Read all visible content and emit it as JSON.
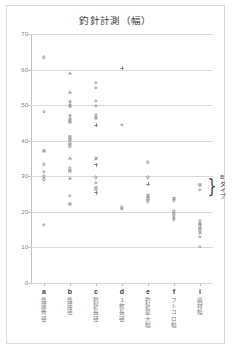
{
  "chart": {
    "title": "釣針計測（幅）",
    "annotation": {
      "brace": "}",
      "label": "Bタイプ"
    }
  },
  "chart_data": {
    "type": "scatter",
    "title": "釣針計測（幅）",
    "xlabel": "",
    "ylabel": "",
    "ylim": [
      0,
      70
    ],
    "yticks": [
      0,
      10,
      20,
      30,
      40,
      50,
      60,
      70
    ],
    "grid": true,
    "legend": "none",
    "categories": [
      "a",
      "b",
      "c",
      "d",
      "e",
      "f",
      "i"
    ],
    "category_names": [
      "角座骨径",
      "角座径",
      "釣針長径",
      "1枚長径",
      "釣針最大幅",
      "フトコロ幅",
      "廃材幅"
    ],
    "annotations": [
      {
        "text": "Bタイプ",
        "category": "i",
        "y_range": [
          25.5,
          28.5
        ],
        "marker": "brace"
      }
    ],
    "series": [
      {
        "name": "a",
        "category": "a",
        "points": [
          {
            "y": 63.5,
            "marker": "circle"
          },
          {
            "y": 48.2,
            "marker": "circle"
          },
          {
            "y": 37.2,
            "marker": "square"
          },
          {
            "y": 33.4,
            "marker": "circle"
          },
          {
            "y": 31.2,
            "marker": "circle"
          },
          {
            "y": 30.0,
            "marker": "circle"
          },
          {
            "y": 29.2,
            "marker": "circle"
          },
          {
            "y": 16.3,
            "marker": "circle"
          }
        ]
      },
      {
        "name": "b",
        "category": "b",
        "points": [
          {
            "y": 59.0,
            "marker": "triangle"
          },
          {
            "y": 53.6,
            "marker": "triangle"
          },
          {
            "y": 51.3,
            "marker": "triangle"
          },
          {
            "y": 50.4,
            "marker": "triangle"
          },
          {
            "y": 49.8,
            "marker": "triangle"
          },
          {
            "y": 47.2,
            "marker": "triangle"
          },
          {
            "y": 46.4,
            "marker": "triangle"
          },
          {
            "y": 45.9,
            "marker": "circle"
          },
          {
            "y": 45.4,
            "marker": "square"
          },
          {
            "y": 41.0,
            "marker": "square"
          },
          {
            "y": 40.3,
            "marker": "square"
          },
          {
            "y": 39.1,
            "marker": "square"
          },
          {
            "y": 38.4,
            "marker": "circle"
          },
          {
            "y": 35.2,
            "marker": "triangle"
          },
          {
            "y": 32.2,
            "marker": "circle"
          },
          {
            "y": 31.6,
            "marker": "square"
          },
          {
            "y": 29.6,
            "marker": "triangle"
          },
          {
            "y": 24.5,
            "marker": "circle"
          },
          {
            "y": 22.3,
            "marker": "square"
          }
        ]
      },
      {
        "name": "c",
        "category": "c",
        "points": [
          {
            "y": 56.2,
            "marker": "circle"
          },
          {
            "y": 54.8,
            "marker": "circle"
          },
          {
            "y": 51.2,
            "marker": "circle"
          },
          {
            "y": 49.8,
            "marker": "circle"
          },
          {
            "y": 47.3,
            "marker": "circle"
          },
          {
            "y": 46.5,
            "marker": "square"
          },
          {
            "y": 44.4,
            "marker": "plus"
          },
          {
            "y": 35.1,
            "marker": "cross"
          },
          {
            "y": 33.3,
            "marker": "plus"
          },
          {
            "y": 29.7,
            "marker": "circle"
          },
          {
            "y": 28.2,
            "marker": "circle"
          },
          {
            "y": 26.6,
            "marker": "square"
          },
          {
            "y": 25.4,
            "marker": "plus"
          }
        ]
      },
      {
        "name": "d",
        "category": "d",
        "points": [
          {
            "y": 60.4,
            "marker": "plus"
          },
          {
            "y": 44.5,
            "marker": "circle"
          },
          {
            "y": 21.3,
            "marker": "circle"
          },
          {
            "y": 20.9,
            "marker": "circle"
          }
        ]
      },
      {
        "name": "e",
        "category": "e",
        "points": [
          {
            "y": 33.9,
            "marker": "circle"
          },
          {
            "y": 29.7,
            "marker": "circle"
          },
          {
            "y": 27.8,
            "marker": "plus"
          },
          {
            "y": 24.6,
            "marker": "cross"
          },
          {
            "y": 23.8,
            "marker": "square"
          },
          {
            "y": 23.0,
            "marker": "circle"
          }
        ]
      },
      {
        "name": "f",
        "category": "f",
        "points": [
          {
            "y": 23.9,
            "marker": "cross"
          },
          {
            "y": 23.2,
            "marker": "circle"
          },
          {
            "y": 20.2,
            "marker": "circle"
          },
          {
            "y": 19.6,
            "marker": "circle"
          },
          {
            "y": 19.0,
            "marker": "circle"
          },
          {
            "y": 18.4,
            "marker": "circle"
          },
          {
            "y": 17.9,
            "marker": "circle"
          }
        ]
      },
      {
        "name": "i",
        "category": "i",
        "points": [
          {
            "y": 27.5,
            "marker": "square"
          },
          {
            "y": 26.2,
            "marker": "circle"
          },
          {
            "y": 17.5,
            "marker": "circle"
          },
          {
            "y": 16.6,
            "marker": "square"
          },
          {
            "y": 15.9,
            "marker": "circle"
          },
          {
            "y": 15.1,
            "marker": "square"
          },
          {
            "y": 14.3,
            "marker": "cross"
          },
          {
            "y": 13.0,
            "marker": "circle"
          },
          {
            "y": 10.2,
            "marker": "circle"
          }
        ]
      }
    ]
  }
}
